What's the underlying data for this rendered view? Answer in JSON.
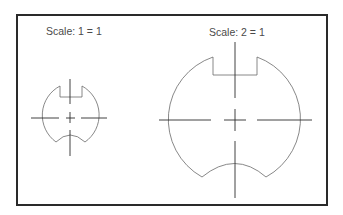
{
  "drawing": {
    "labels": {
      "small": "Scale: 1 = 1",
      "large": "Scale: 2 = 1"
    },
    "views": [
      {
        "name": "small-view",
        "scale": "1 = 1",
        "center": [
          70,
          118
        ],
        "radius": 33
      },
      {
        "name": "large-view",
        "scale": "2 = 1",
        "center": [
          235,
          120
        ],
        "radius": 66
      }
    ],
    "colors": {
      "frame": "#2a2a2a",
      "outline": "#6a6a6a",
      "centerline": "#2e2e2e",
      "text": "#4a4a4a"
    }
  }
}
